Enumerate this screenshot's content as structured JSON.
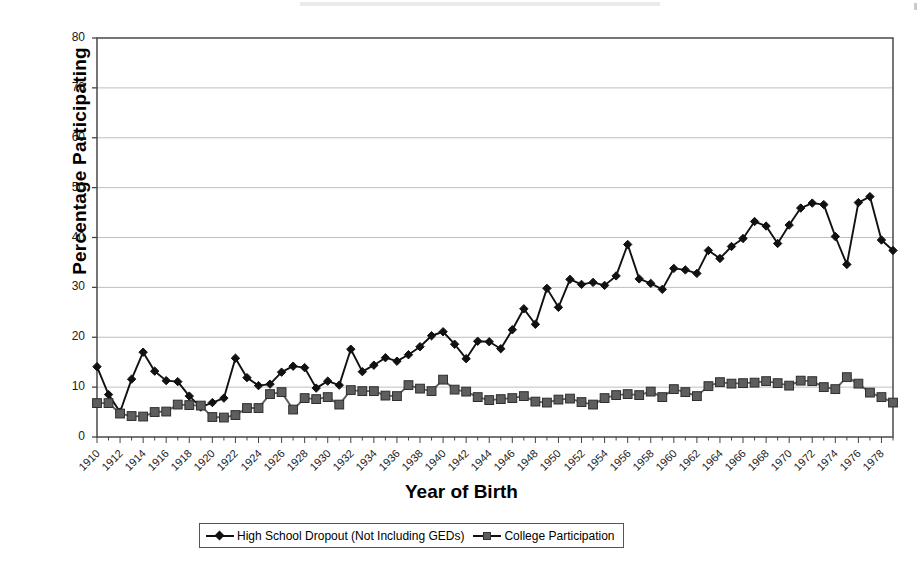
{
  "chart_data": {
    "type": "line",
    "title": "",
    "xlabel": "Year of Birth",
    "ylabel": "Percentage Participating",
    "xlim": [
      1910,
      1979
    ],
    "ylim": [
      0,
      80
    ],
    "yticks": [
      0,
      10,
      20,
      30,
      40,
      50,
      60,
      70,
      80
    ],
    "grid": true,
    "legend_position": "bottom",
    "xticks": [
      1910,
      1912,
      1914,
      1916,
      1918,
      1920,
      1922,
      1924,
      1926,
      1928,
      1930,
      1932,
      1934,
      1936,
      1938,
      1940,
      1942,
      1944,
      1946,
      1948,
      1950,
      1952,
      1954,
      1956,
      1958,
      1960,
      1962,
      1964,
      1966,
      1968,
      1970,
      1972,
      1974,
      1976,
      1978
    ],
    "x": [
      1910,
      1911,
      1912,
      1913,
      1914,
      1915,
      1916,
      1917,
      1918,
      1919,
      1920,
      1921,
      1922,
      1923,
      1924,
      1925,
      1926,
      1927,
      1928,
      1929,
      1930,
      1931,
      1932,
      1933,
      1934,
      1935,
      1936,
      1937,
      1938,
      1939,
      1940,
      1941,
      1942,
      1943,
      1944,
      1945,
      1946,
      1947,
      1948,
      1949,
      1950,
      1951,
      1952,
      1953,
      1954,
      1955,
      1956,
      1957,
      1958,
      1959,
      1960,
      1961,
      1962,
      1963,
      1964,
      1965,
      1966,
      1967,
      1968,
      1969,
      1970,
      1971,
      1972,
      1973,
      1974,
      1975,
      1976,
      1977,
      1978,
      1979
    ],
    "series": [
      {
        "name": "High School Dropout (Not Including GEDs)",
        "marker": "diamond",
        "color": "#111111",
        "values": [
          14.1,
          8.5,
          5.0,
          11.6,
          17.0,
          13.2,
          11.3,
          11.1,
          8.2,
          6.0,
          6.9,
          7.8,
          15.8,
          11.9,
          10.3,
          10.6,
          13.0,
          14.2,
          13.9,
          9.8,
          11.2,
          10.4,
          17.6,
          13.1,
          14.4,
          15.9,
          15.2,
          16.5,
          18.1,
          20.3,
          21.1,
          18.6,
          15.7,
          19.2,
          19.1,
          17.7,
          21.5,
          25.7,
          22.6,
          29.8,
          26.0,
          31.6,
          30.6,
          31.0,
          30.4,
          32.3,
          38.6,
          31.7,
          30.8,
          29.6,
          33.8,
          33.5,
          32.8,
          37.4,
          35.8,
          38.2,
          39.8,
          43.2,
          42.3,
          38.8,
          42.5,
          45.9,
          46.9,
          46.6,
          40.2,
          34.6,
          47.0,
          48.2,
          39.5,
          37.4
        ]
      },
      {
        "name": "College Participation",
        "marker": "square",
        "color": "#5e5e5e",
        "values": [
          6.8,
          6.8,
          4.7,
          4.2,
          4.1,
          5.0,
          5.1,
          6.5,
          6.4,
          6.3,
          4.0,
          3.9,
          4.4,
          5.8,
          5.8,
          8.6,
          9.0,
          5.5,
          7.8,
          7.6,
          8.0,
          6.5,
          9.4,
          9.2,
          9.2,
          8.3,
          8.2,
          10.4,
          9.7,
          9.2,
          11.5,
          9.5,
          9.1,
          8.0,
          7.4,
          7.6,
          7.8,
          8.2,
          7.1,
          6.9,
          7.5,
          7.7,
          7.0,
          6.5,
          7.8,
          8.4,
          8.6,
          8.4,
          9.1,
          8.0,
          9.6,
          9.0,
          8.2,
          10.2,
          11.0,
          10.7,
          10.8,
          10.9,
          11.2,
          10.8,
          10.3,
          11.3,
          11.2,
          10.0,
          9.6,
          12.0,
          10.7,
          8.9,
          8.0,
          6.9
        ]
      }
    ]
  }
}
